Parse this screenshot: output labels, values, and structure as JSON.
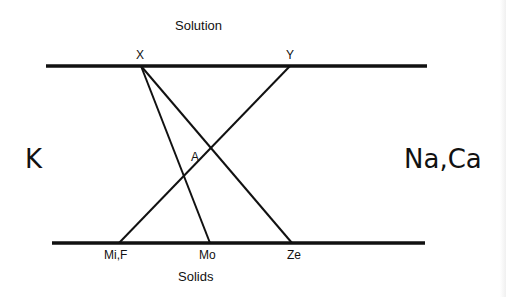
{
  "diagram": {
    "top_phase_label": "Solution",
    "bottom_phase_label": "Solids",
    "left_label": "K",
    "right_label": "Na,Ca",
    "intersection_label": "A",
    "top_points": [
      {
        "id": "X",
        "label": "X"
      },
      {
        "id": "Y",
        "label": "Y"
      }
    ],
    "bottom_points": [
      {
        "id": "MiF",
        "label": "Mi,F"
      },
      {
        "id": "Mo",
        "label": "Mo"
      },
      {
        "id": "Ze",
        "label": "Ze"
      }
    ],
    "tie_lines": [
      {
        "from": "X",
        "to": "Mo"
      },
      {
        "from": "X",
        "to": "Ze"
      },
      {
        "from": "Y",
        "to": "MiF"
      }
    ],
    "line_color": "#111111",
    "background_color": "#ffffff"
  }
}
